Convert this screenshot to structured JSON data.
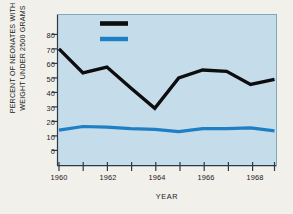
{
  "chart_data": {
    "type": "line",
    "title": "",
    "xlabel": "YEAR",
    "ylabel": "PERCENT OF NEONATES WITH WEIGHT UNDER 2500 GRAMS",
    "ylabel_line1": "PERCENT OF  NEONATES WITH",
    "ylabel_line2": "WEIGHT UNDER 2500 GRAMS",
    "x": [
      1960,
      1961,
      1962,
      1963,
      1964,
      1965,
      1966,
      1967,
      1968,
      1969
    ],
    "xlim": [
      1960,
      1969
    ],
    "ylim": [
      0,
      85
    ],
    "yticks": [
      0,
      10,
      20,
      30,
      40,
      50,
      60,
      70,
      80
    ],
    "xticks": [
      1960,
      1961,
      1962,
      1963,
      1964,
      1965,
      1966,
      1967,
      1968,
      1969
    ],
    "xtick_labels": [
      "1960",
      "",
      "1962",
      "",
      "1964",
      "",
      "1966",
      "",
      "1968",
      ""
    ],
    "grid": false,
    "legend_position": "top-center",
    "plot_background": "#c5dcea",
    "series": [
      {
        "name": "DRUG ADDICTED MOTHERS",
        "color": "#0d0d0d",
        "values": [
          70,
          53.5,
          57.5,
          43,
          29,
          50,
          55.5,
          54.5,
          45.5,
          49
        ]
      },
      {
        "name": "HOSPITAL INCIDENCE",
        "color": "#1f7fc4",
        "values": [
          14,
          16.5,
          16,
          15,
          14.5,
          13,
          15,
          15,
          15.5,
          13.5
        ]
      }
    ]
  },
  "legend": {
    "items": [
      {
        "label": "DRUG ADDICTED MOTHERS",
        "color": "#0d0d0d"
      },
      {
        "label": "HOSPITAL INCIDENCE",
        "color": "#1f7fc4"
      }
    ]
  },
  "ytick_labels": [
    "80",
    "70",
    "60",
    "50",
    "40",
    "30",
    "20",
    "10",
    "0"
  ],
  "colors": {
    "page_background": "#f2f0ea",
    "plot_background": "#c5dcea",
    "series_black": "#0d0d0d",
    "series_blue": "#1f7fc4",
    "axis": "#2b3a44",
    "text": "#1a1a1a"
  }
}
